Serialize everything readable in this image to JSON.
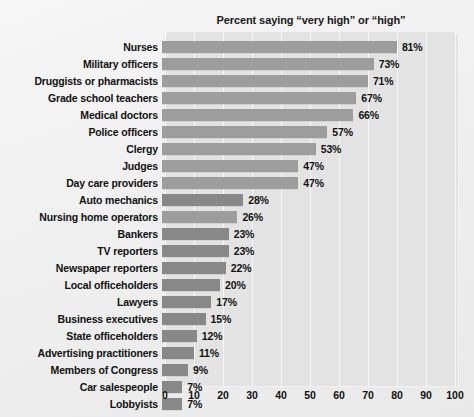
{
  "chart_data": {
    "type": "bar",
    "orientation": "horizontal",
    "title": "Percent saying “very high” or “high”",
    "xlabel": "",
    "ylabel": "",
    "xlim": [
      0,
      100
    ],
    "xticks": [
      0,
      10,
      20,
      30,
      40,
      50,
      60,
      70,
      80,
      90,
      100
    ],
    "grid": true,
    "legend": "none",
    "value_suffix": "%",
    "categories": [
      "Nurses",
      "Military officers",
      "Druggists or pharmacists",
      "Grade school teachers",
      "Medical doctors",
      "Police officers",
      "Clergy",
      "Judges",
      "Day care providers",
      "Auto mechanics",
      "Nursing home operators",
      "Bankers",
      "TV reporters",
      "Newspaper reporters",
      "Local officeholders",
      "Lawyers",
      "Business executives",
      "State officeholders",
      "Advertising practitioners",
      "Members of Congress",
      "Car salespeople",
      "Lobbyists"
    ],
    "values": [
      81,
      73,
      71,
      67,
      66,
      57,
      53,
      47,
      47,
      28,
      26,
      23,
      23,
      22,
      20,
      17,
      15,
      12,
      11,
      9,
      7,
      7
    ],
    "value_labels": [
      "81%",
      "73%",
      "71%",
      "67%",
      "66%",
      "57%",
      "53%",
      "47%",
      "47%",
      "28%",
      "26%",
      "23%",
      "23%",
      "22%",
      "20%",
      "17%",
      "15%",
      "12%",
      "11%",
      "9%",
      "7%",
      "7%"
    ],
    "bar_shades": [
      "light",
      "light",
      "light",
      "light",
      "light",
      "light",
      "light",
      "light",
      "light",
      "dark",
      "light",
      "dark",
      "dark",
      "dark",
      "dark",
      "dark",
      "dark",
      "dark",
      "dark",
      "dark",
      "dark",
      "dark"
    ],
    "colors": {
      "bar_light": "#9d9d9d",
      "bar_dark": "#888888",
      "panel": "#e3e3e3",
      "gridline": "#f7f7f7",
      "background": "#f0f0f0",
      "text": "#111111"
    }
  }
}
